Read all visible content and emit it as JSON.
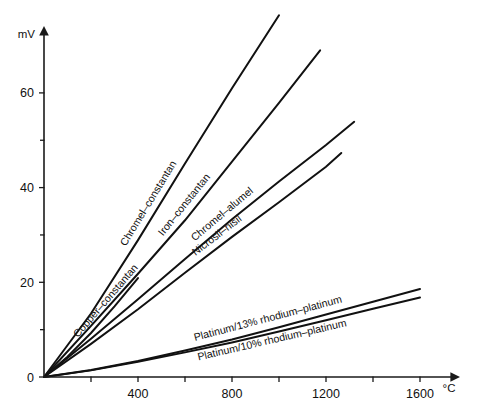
{
  "chart_data": {
    "type": "line",
    "title": "",
    "xlabel": "°C",
    "ylabel": "mV",
    "xlim": [
      0,
      1750
    ],
    "ylim": [
      0,
      78
    ],
    "grid": false,
    "legend_position": "inline-along-curves",
    "x_major_ticks": [
      400,
      800,
      1200,
      1600
    ],
    "x_minor_ticks": [
      200,
      600,
      1000,
      1400
    ],
    "x_tick_labels": [
      "400",
      "800",
      "1200",
      "1600"
    ],
    "y_major_ticks": [
      0,
      20,
      40,
      60
    ],
    "y_minor_ticks": [
      10,
      30,
      50
    ],
    "y_tick_labels": [
      "0",
      "20",
      "40",
      "60"
    ],
    "series": [
      {
        "name": "Chromel–constantan",
        "x": [
          0,
          200,
          400,
          600,
          800,
          1000
        ],
        "values": [
          0,
          13.4,
          28.9,
          45.1,
          61.0,
          76.4
        ]
      },
      {
        "name": "Iron–constantan",
        "x": [
          0,
          200,
          400,
          600,
          800,
          1000,
          1175
        ],
        "values": [
          0,
          10.8,
          21.8,
          33.1,
          45.5,
          57.9,
          69.0
        ]
      },
      {
        "name": "Chromel–alumel",
        "x": [
          0,
          200,
          400,
          600,
          800,
          1000,
          1200,
          1320
        ],
        "values": [
          0,
          8.1,
          16.4,
          24.9,
          33.3,
          41.3,
          49.0,
          53.9
        ]
      },
      {
        "name": "Nicrosil–nisil",
        "x": [
          0,
          200,
          400,
          600,
          800,
          1000,
          1200,
          1265
        ],
        "values": [
          0,
          7.0,
          14.3,
          22.0,
          29.6,
          36.9,
          44.4,
          47.3
        ]
      },
      {
        "name": "Copper–constantan",
        "x": [
          0,
          100,
          200,
          300,
          400
        ],
        "values": [
          0,
          4.3,
          9.3,
          14.9,
          20.9
        ]
      },
      {
        "name": "Platinum/13% rhodium–platinum",
        "x": [
          0,
          200,
          400,
          600,
          800,
          1000,
          1200,
          1400,
          1600
        ],
        "values": [
          0,
          1.5,
          3.4,
          5.6,
          7.9,
          10.5,
          13.2,
          15.9,
          18.6
        ]
      },
      {
        "name": "Platinum/10% rhodium–platinum",
        "x": [
          0,
          200,
          400,
          600,
          800,
          1000,
          1200,
          1400,
          1600
        ],
        "values": [
          0,
          1.4,
          3.2,
          5.2,
          7.3,
          9.6,
          12.0,
          14.4,
          16.8
        ]
      }
    ]
  },
  "labels": {
    "y_axis_unit": "mV",
    "x_axis_unit": "°C"
  }
}
